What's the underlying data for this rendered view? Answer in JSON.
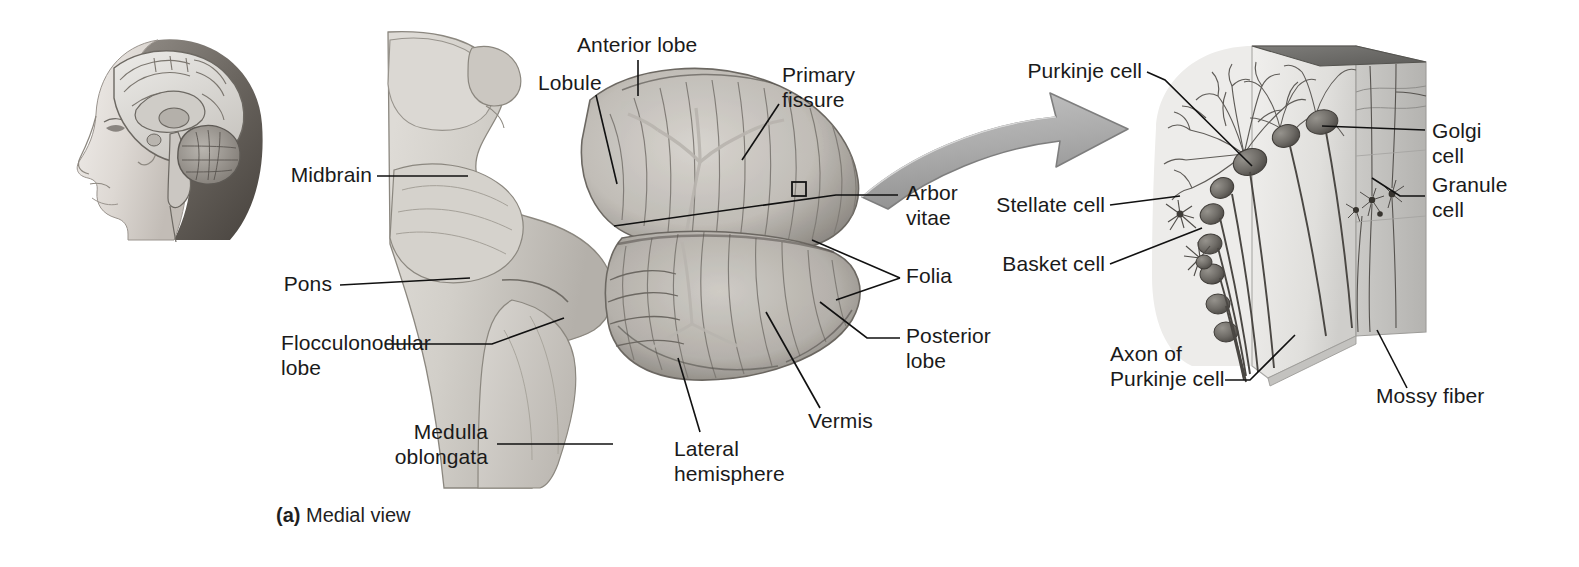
{
  "figure": {
    "caption_prefix": "(a)",
    "caption_text": " Medial view",
    "background": "#ffffff"
  },
  "colors": {
    "text": "#1a1a1a",
    "leader_line": "#111111",
    "arrow_fill": "#b0b0b0",
    "arrow_shade": "#8c8c8c",
    "arrow_stroke": "#6e6e6e",
    "block_front": "#e2e2e2",
    "block_side": "#bdbdbd",
    "block_top": "#6f6f6f",
    "cell_body": "#6a6a6a",
    "fiber": "#4a4a4a",
    "specimen_light": "#d8d6d2",
    "specimen_mid": "#b6b3ae",
    "specimen_dark": "#7d7a76"
  },
  "panels": {
    "head_inset": {
      "name": "Head with midsagittal brain section",
      "orientation": "left-facing profile"
    },
    "specimen_photo": {
      "name": "Midsagittal cerebellum and brainstem specimen"
    },
    "block_diagram": {
      "name": "Cerebellar cortex three-dimensional block"
    }
  },
  "labels_left": [
    {
      "id": "midbrain",
      "text": "Midbrain"
    },
    {
      "id": "pons",
      "text": "Pons"
    },
    {
      "id": "flocculonodular",
      "text": "Flocculonodular\nlobe"
    },
    {
      "id": "medulla",
      "text": "Medulla\noblongata"
    }
  ],
  "labels_specimen_top": [
    {
      "id": "lobule",
      "text": "Lobule"
    },
    {
      "id": "anterior-lobe",
      "text": "Anterior lobe"
    },
    {
      "id": "primary-fissure",
      "text": "Primary\nfissure"
    }
  ],
  "labels_specimen_right": [
    {
      "id": "arbor-vitae",
      "text": "Arbor\nvitae"
    },
    {
      "id": "folia",
      "text": "Folia"
    },
    {
      "id": "posterior-lobe",
      "text": "Posterior\nlobe"
    }
  ],
  "labels_specimen_bottom": [
    {
      "id": "lateral-hemisphere",
      "text": "Lateral\nhemisphere"
    },
    {
      "id": "vermis",
      "text": "Vermis"
    }
  ],
  "labels_block_left": [
    {
      "id": "purkinje-cell",
      "text": "Purkinje cell"
    },
    {
      "id": "stellate-cell",
      "text": "Stellate cell"
    },
    {
      "id": "basket-cell",
      "text": "Basket cell"
    },
    {
      "id": "axon-purkinje",
      "text": "Axon of\nPurkinje cell"
    }
  ],
  "labels_block_right": [
    {
      "id": "golgi-cell",
      "text": "Golgi\ncell"
    },
    {
      "id": "granule-cell",
      "text": "Granule\ncell"
    },
    {
      "id": "mossy-fiber",
      "text": "Mossy fiber"
    }
  ],
  "markers": {
    "magnify_box": "small square outline marking the magnified cortex region"
  }
}
